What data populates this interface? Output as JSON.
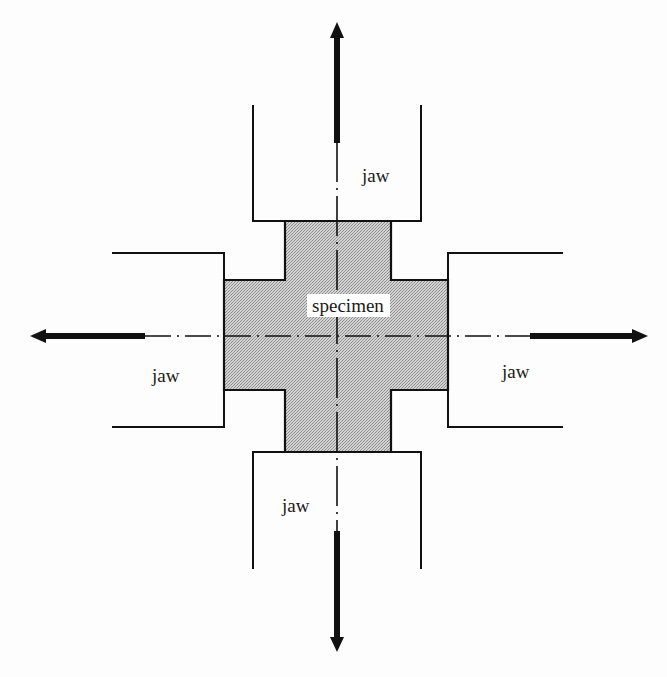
{
  "diagram": {
    "type": "biaxial-tension-setup",
    "labels": {
      "specimen": "specimen",
      "jaw_top": "jaw",
      "jaw_left": "jaw",
      "jaw_right": "jaw",
      "jaw_bottom": "jaw"
    },
    "colors": {
      "line": "#111111",
      "specimen_fill": "#c4c4c4",
      "background": "#fdfdfd",
      "label_bg": "#ffffff"
    },
    "arrows": [
      {
        "direction": "up",
        "meaning": "tensile load"
      },
      {
        "direction": "down",
        "meaning": "tensile load"
      },
      {
        "direction": "left",
        "meaning": "tensile load"
      },
      {
        "direction": "right",
        "meaning": "tensile load"
      }
    ],
    "centerlines": [
      "horizontal dash-dot axis",
      "vertical dash-dot axis"
    ]
  }
}
